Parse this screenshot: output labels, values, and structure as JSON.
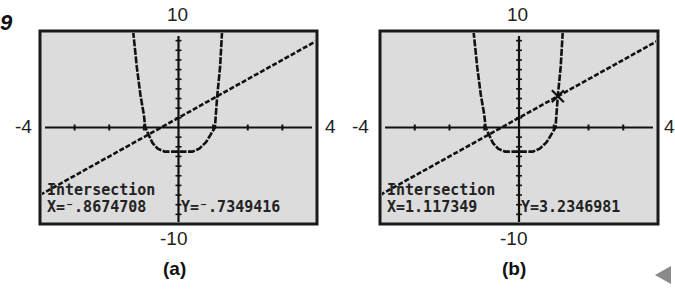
{
  "figure": {
    "number": "9",
    "arrow_icon": "left-triangle-nav-icon"
  },
  "panels": [
    {
      "caption": "(a)",
      "window": {
        "xmin": "-4",
        "xmax": "4",
        "ymin": "-10",
        "ymax": "10"
      },
      "screen": {
        "title": "Intersection",
        "x_readout": "X=⁻.8674708",
        "y_readout": "Y=⁻.7349416"
      },
      "marker": {
        "x": -0.8674708,
        "y": -0.7349416
      }
    },
    {
      "caption": "(b)",
      "window": {
        "xmin": "-4",
        "xmax": "4",
        "ymin": "-10",
        "ymax": "10"
      },
      "screen": {
        "title": "Intersection",
        "x_readout": "X=1.117349",
        "y_readout": "Y=3.2346981"
      },
      "marker": {
        "x": 1.117349,
        "y": 3.2346981
      }
    }
  ],
  "chart_data": [
    {
      "type": "line",
      "title": "(a)",
      "xlim": [
        -4,
        4
      ],
      "ylim": [
        -10,
        10
      ],
      "grid": false,
      "series": [
        {
          "name": "curve",
          "points": [
            [
              -1.31,
              10
            ],
            [
              -1.2,
              6.2
            ],
            [
              -1.1,
              3.4
            ],
            [
              -1.0,
              1.3
            ],
            [
              -0.96,
              0
            ],
            [
              -0.867,
              -0.73
            ],
            [
              -0.75,
              -1.6
            ],
            [
              -0.6,
              -2.2
            ],
            [
              -0.4,
              -2.5
            ],
            [
              0,
              -2.5
            ],
            [
              0.4,
              -2.5
            ],
            [
              0.6,
              -2.2
            ],
            [
              0.8,
              -1.5
            ],
            [
              0.95,
              -0.6
            ],
            [
              1.05,
              0
            ],
            [
              1.117,
              3.23
            ],
            [
              1.2,
              6.3
            ],
            [
              1.26,
              10
            ]
          ]
        },
        {
          "name": "line",
          "points": [
            [
              -4,
              -7
            ],
            [
              4,
              9
            ]
          ]
        }
      ],
      "annotations": [
        "Intersection",
        "X=-.8674708",
        "Y=-.7349416"
      ]
    },
    {
      "type": "line",
      "title": "(b)",
      "xlim": [
        -4,
        4
      ],
      "ylim": [
        -10,
        10
      ],
      "grid": false,
      "series": [
        {
          "name": "curve",
          "points": [
            [
              -1.31,
              10
            ],
            [
              -1.2,
              6.2
            ],
            [
              -1.1,
              3.4
            ],
            [
              -1.0,
              1.3
            ],
            [
              -0.96,
              0
            ],
            [
              -0.867,
              -0.73
            ],
            [
              -0.75,
              -1.6
            ],
            [
              -0.6,
              -2.2
            ],
            [
              -0.4,
              -2.5
            ],
            [
              0,
              -2.5
            ],
            [
              0.4,
              -2.5
            ],
            [
              0.6,
              -2.2
            ],
            [
              0.8,
              -1.5
            ],
            [
              0.95,
              -0.6
            ],
            [
              1.05,
              0
            ],
            [
              1.117,
              3.23
            ],
            [
              1.2,
              6.3
            ],
            [
              1.26,
              10
            ]
          ]
        },
        {
          "name": "line",
          "points": [
            [
              -4,
              -7
            ],
            [
              4,
              9
            ]
          ]
        }
      ],
      "annotations": [
        "Intersection",
        "X=1.117349",
        "Y=3.2346981"
      ]
    }
  ]
}
